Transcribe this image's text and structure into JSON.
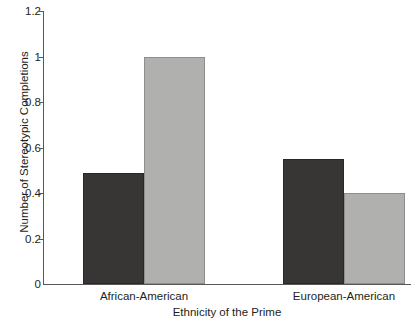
{
  "chart_data": {
    "type": "bar",
    "title": "",
    "xlabel": "Ethnicity of the Prime",
    "ylabel": "Number of Stereotypic Completions",
    "categories": [
      "African-American",
      "European-American"
    ],
    "series": [
      {
        "name": "dark-bar",
        "color": "#383634",
        "values": [
          0.49,
          0.55
        ]
      },
      {
        "name": "light-bar",
        "color": "#b0b0ae",
        "values": [
          1.0,
          0.4
        ]
      }
    ],
    "ylim": [
      0,
      1.2
    ],
    "yticks": [
      0,
      0.2,
      0.4,
      0.6,
      0.8,
      1,
      1.2
    ],
    "ytick_labels": [
      "0",
      "0.2",
      "0.4",
      "0.6",
      "0.8",
      "1",
      "1.2"
    ],
    "grid": false,
    "legend": "none"
  }
}
